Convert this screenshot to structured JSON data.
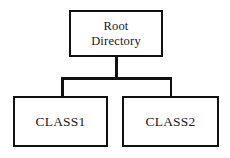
{
  "diagram": {
    "type": "tree",
    "canvas": {
      "width": 230,
      "height": 158,
      "background_color": "#ffffff"
    },
    "style": {
      "node_border_color": "#111111",
      "node_fill_color": "#ffffff",
      "connector_color": "#111111",
      "text_color": "#1a1a1a"
    },
    "nodes": [
      {
        "id": "root",
        "label": "Root\nDirectory",
        "level": 0
      },
      {
        "id": "class1",
        "label": "CLASS1",
        "level": 1
      },
      {
        "id": "class2",
        "label": "CLASS2",
        "level": 1
      }
    ],
    "edges": [
      {
        "from": "root",
        "to": "class1"
      },
      {
        "from": "root",
        "to": "class2"
      }
    ]
  }
}
